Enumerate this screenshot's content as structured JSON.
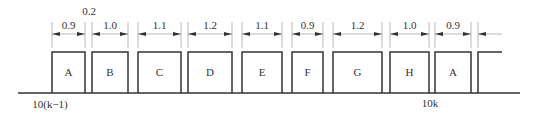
{
  "diagram": {
    "baseline": {
      "x1": 18,
      "x2": 520,
      "y": 93
    },
    "box_top": 52,
    "boxes": [
      {
        "label": "A",
        "x1": 52,
        "x2": 85,
        "duration": "0.9"
      },
      {
        "label": "B",
        "x1": 92,
        "x2": 128,
        "duration": "1.0"
      },
      {
        "label": "C",
        "x1": 138,
        "x2": 181,
        "duration": "1.1"
      },
      {
        "label": "D",
        "x1": 188,
        "x2": 232,
        "duration": "1.2"
      },
      {
        "label": "E",
        "x1": 242,
        "x2": 282,
        "duration": "1.1"
      },
      {
        "label": "F",
        "x1": 292,
        "x2": 323,
        "duration": "0.9"
      },
      {
        "label": "G",
        "x1": 333,
        "x2": 382,
        "duration": "1.2"
      },
      {
        "label": "H",
        "x1": 390,
        "x2": 429,
        "duration": "1.0"
      },
      {
        "label": "A",
        "x1": 435,
        "x2": 471,
        "duration": "0.9"
      }
    ],
    "partial_box": {
      "x1": 478,
      "x2": 502
    },
    "gap_annotation": {
      "label": "0.2",
      "x": 89,
      "y": 15
    },
    "axis_labels": [
      {
        "text": "10(k−1)",
        "x": 50,
        "y": 108
      },
      {
        "text": "10k",
        "x": 430,
        "y": 107
      }
    ],
    "colors": {
      "line": "#333333",
      "dim_line": "#999999",
      "arrow": "#333333"
    }
  }
}
